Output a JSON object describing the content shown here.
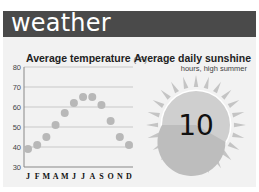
{
  "header": {
    "title": "weather"
  },
  "temperature_chart": {
    "title": "Average temperature",
    "unit": "(°F)"
  },
  "sunshine": {
    "title": "Average daily sunshine",
    "subtitle": "hours, high summer",
    "value": "10",
    "hours": 10,
    "total_hours": 24
  },
  "colors": {
    "header_bg": "#4a4a4a",
    "panel_bg": "#f2f2f2",
    "dot": "#b8b8b8",
    "gridline": "#c8c8c8",
    "sun_fill": "#bdbdbd",
    "sun_fill_light": "#cfcfcf",
    "sun_rays": "#c4c4c4"
  },
  "chart_data": [
    {
      "type": "scatter",
      "title": "Average temperature",
      "unit": "°F",
      "categories": [
        "J",
        "F",
        "M",
        "A",
        "M",
        "J",
        "J",
        "A",
        "S",
        "O",
        "N",
        "D"
      ],
      "values": [
        39,
        41,
        45,
        51,
        57,
        62,
        65,
        65,
        61,
        53,
        45,
        41
      ],
      "yticks": [
        30,
        40,
        50,
        60,
        70,
        80
      ],
      "ylim": [
        30,
        80
      ],
      "grid": true,
      "xlabel": "",
      "ylabel": ""
    },
    {
      "type": "pie",
      "title": "Average daily sunshine",
      "subtitle": "hours, high summer",
      "labels": [
        "sunshine hours",
        "remaining hours"
      ],
      "values": [
        10,
        14
      ],
      "annotation": "10"
    }
  ]
}
